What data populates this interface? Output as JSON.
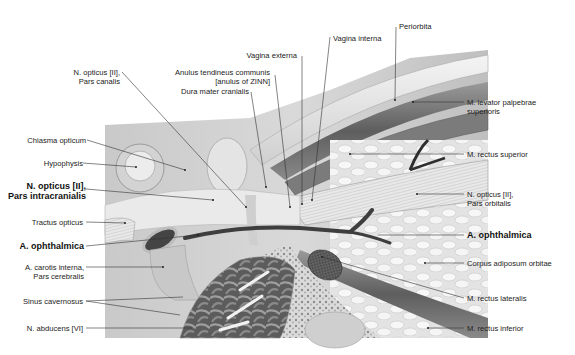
{
  "figure": {
    "labels_left": [
      {
        "id": "chiasma",
        "text": "Chiasma opticum"
      },
      {
        "id": "hypophysis",
        "text": "Hypophysis"
      },
      {
        "id": "n_opticus_intracranial",
        "text": "N. opticus [II],",
        "sub": "Pars intracranialis",
        "bold": true
      },
      {
        "id": "tractus",
        "text": "Tractus opticus"
      },
      {
        "id": "a_ophthalmica_left",
        "text": "A. ophthalmica",
        "bold": true
      },
      {
        "id": "carotis",
        "text": "A. carotis interna,",
        "sub": "Pars cerebralis"
      },
      {
        "id": "sinus",
        "text": "Sinus cavernosus"
      },
      {
        "id": "abducens",
        "text": "N. abducens [VI]"
      }
    ],
    "labels_top": [
      {
        "id": "n_opticus_canal",
        "text": "N. opticus [II],",
        "sub": "Pars canalis"
      },
      {
        "id": "anulus",
        "text": "Anulus tendineus communis",
        "sub": "[anulus of ZINN]"
      },
      {
        "id": "dura",
        "text": "Dura mater cranialis"
      },
      {
        "id": "vagina_externa",
        "text": "Vagina externa"
      },
      {
        "id": "vagina_interna",
        "text": "Vagina interna"
      },
      {
        "id": "periorbita",
        "text": "Periorbita"
      }
    ],
    "labels_right": [
      {
        "id": "levator",
        "text": "M. levator palpebrae",
        "sub": "superioris"
      },
      {
        "id": "rectus_sup",
        "text": "M. rectus superior"
      },
      {
        "id": "n_opticus_orbital",
        "text": "N. opticus [II],",
        "sub": "Pars orbitalis"
      },
      {
        "id": "a_ophthalmica_right",
        "text": "A. ophthalmica",
        "bold": true
      },
      {
        "id": "corpus",
        "text": "Corpus adiposum orbitae"
      },
      {
        "id": "rectus_lat",
        "text": "M. rectus lateralis"
      },
      {
        "id": "rectus_inf",
        "text": "M. rectus inferior"
      }
    ]
  },
  "colors": {
    "background": "#ffffff",
    "text": "#222222",
    "leader": "#333333",
    "tissue_light": "#e6e6e6",
    "tissue_mid": "#bdbdbd",
    "tissue_dark": "#6e6e6e",
    "vessel": "#4a4a4a"
  }
}
